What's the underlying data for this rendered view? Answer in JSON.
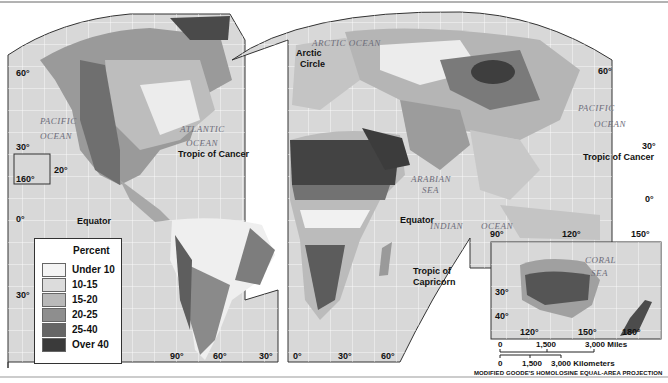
{
  "map": {
    "title": "",
    "projection_label": "MODIFIED GOODE'S HOMOLOSINE EQUAL-AREA PROJECTION",
    "legend": {
      "title": "Percent",
      "items": [
        {
          "label": "Under 10",
          "color": "#f4f4f4"
        },
        {
          "label": "10-15",
          "color": "#dcdcdc"
        },
        {
          "label": "15-20",
          "color": "#b9b9b9"
        },
        {
          "label": "20-25",
          "color": "#8e8e8e"
        },
        {
          "label": "25-40",
          "color": "#666666"
        },
        {
          "label": "Over 40",
          "color": "#3a3a3a"
        }
      ]
    },
    "oceans": {
      "pacific_west_1": "PACIFIC",
      "pacific_west_2": "OCEAN",
      "atlantic_1": "ATLANTIC",
      "atlantic_2": "OCEAN",
      "arctic": "ARCTIC OCEAN",
      "pacific_east_1": "PACIFIC",
      "pacific_east_2": "OCEAN",
      "arabian_1": "ARABIAN",
      "arabian_2": "SEA",
      "indian": "INDIAN",
      "indian_ocean": "OCEAN",
      "coral_1": "CORAL",
      "coral_2": "SEA"
    },
    "lines": {
      "arctic_circle_1": "Arctic",
      "arctic_circle_2": "Circle",
      "tropic_cancer_west": "Tropic of Cancer",
      "tropic_cancer_east": "Tropic of Cancer",
      "equator_west": "Equator",
      "equator_east": "Equator",
      "tropic_capricorn_1": "Tropic of",
      "tropic_capricorn_2": "Capricorn"
    },
    "degrees": {
      "lat_60_w": "60°",
      "lat_30_w": "30°",
      "lat_0_w": "0°",
      "lat_30s_w": "30°",
      "hawaii_20": "20°",
      "hawaii_160": "160°",
      "lat_60_e": "60°",
      "lat_30_e": "30°",
      "lat_0_e": "0°",
      "lon_90w": "90°",
      "lon_60w": "60°",
      "lon_30w": "30°",
      "lon_0": "0°",
      "lon_30e": "30°",
      "lon_60e": "60°",
      "lon_90e": "90°",
      "lon_120e": "120°",
      "lon_150e": "150°",
      "aus_30": "30°",
      "aus_40": "40°",
      "aus_120": "120°",
      "aus_150": "150°",
      "aus_180": "180°"
    },
    "scale": {
      "miles": {
        "zero": "0",
        "mid": "1,500",
        "end": "3,000 Miles"
      },
      "km": {
        "zero": "0",
        "mid": "1,500",
        "end": "3,000 Kilometers"
      }
    }
  }
}
